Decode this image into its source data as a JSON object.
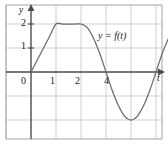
{
  "figure": {
    "name": "graph-of-y-equals-f-of-t",
    "width": 168,
    "height": 144,
    "background_color": "#ffffff",
    "border_color": "#9a9a9a",
    "grid_color": "#b9b9b9",
    "axis_color": "#4a4a4a",
    "curve_color": "#6b6b6b"
  },
  "annotations": {
    "curve_label": "y = f(t)",
    "y_axis_label": "y",
    "x_axis_label": "t"
  },
  "chart_data": {
    "type": "line",
    "title": "",
    "subtitle": "",
    "xlabel": "t",
    "ylabel": "y",
    "xlim": [
      -1.2,
      6.5
    ],
    "ylim": [
      -3,
      2.9
    ],
    "grid": true,
    "legend": null,
    "x_ticks": [
      0,
      1,
      2,
      4
    ],
    "x_tick_labels": [
      "0",
      "1",
      "2",
      "4"
    ],
    "y_ticks": [
      1,
      2
    ],
    "y_tick_labels": [
      "1",
      "2"
    ],
    "x_gridlines": [
      -1,
      0,
      1,
      2,
      3,
      4,
      5,
      6
    ],
    "y_gridlines": [
      -3,
      -2,
      -1,
      0,
      1,
      2
    ],
    "annotations": [
      {
        "text": "y = f(t)",
        "x": 3.7,
        "y": 1.7
      }
    ],
    "series": [
      {
        "name": "f(t)",
        "color": "#6b6b6b",
        "description": "Linear rise from (0,0) to (1,2); constant at 2 from t=1 to t=2; sinusoidal dip crossing zero near t=3, minimum -2 at t=4, rising back through zero near t=5.5 and continuing upward.",
        "points": [
          {
            "t": 0.0,
            "y": 0.0
          },
          {
            "t": 0.25,
            "y": 0.5
          },
          {
            "t": 0.5,
            "y": 1.0
          },
          {
            "t": 0.75,
            "y": 1.5
          },
          {
            "t": 1.0,
            "y": 2.0
          },
          {
            "t": 1.25,
            "y": 2.0
          },
          {
            "t": 1.5,
            "y": 2.0
          },
          {
            "t": 1.75,
            "y": 2.0
          },
          {
            "t": 2.0,
            "y": 2.0
          },
          {
            "t": 2.25,
            "y": 1.85
          },
          {
            "t": 2.5,
            "y": 1.41
          },
          {
            "t": 2.75,
            "y": 0.77
          },
          {
            "t": 3.0,
            "y": 0.0
          },
          {
            "t": 3.25,
            "y": -0.77
          },
          {
            "t": 3.5,
            "y": -1.41
          },
          {
            "t": 3.75,
            "y": -1.85
          },
          {
            "t": 4.0,
            "y": -2.0
          },
          {
            "t": 4.25,
            "y": -1.85
          },
          {
            "t": 4.5,
            "y": -1.41
          },
          {
            "t": 4.75,
            "y": -0.77
          },
          {
            "t": 5.0,
            "y": 0.0
          },
          {
            "t": 5.25,
            "y": 0.77
          },
          {
            "t": 5.5,
            "y": 1.41
          },
          {
            "t": 5.62,
            "y": 1.7
          }
        ]
      }
    ]
  }
}
